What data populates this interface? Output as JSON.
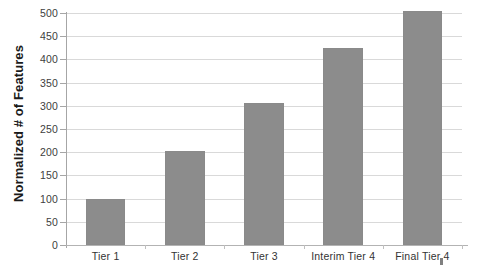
{
  "chart_data": {
    "type": "bar",
    "title": "",
    "xlabel": "",
    "ylabel": "Normalized # of Features",
    "categories": [
      "Tier 1",
      "Tier 2",
      "Tier 3",
      "Interim Tier 4",
      "Final Tier 4"
    ],
    "values": [
      100,
      203,
      305,
      425,
      505
    ],
    "ylim": [
      0,
      500
    ],
    "yticks": [
      0,
      50,
      100,
      150,
      200,
      250,
      300,
      350,
      400,
      450,
      500
    ],
    "ytick_labels": [
      "0",
      "50",
      "100",
      "150",
      "200",
      "250",
      "300",
      "350",
      "400",
      "450",
      "500"
    ],
    "grid": true,
    "grid_axis": "y",
    "legend": false,
    "series": [
      {
        "name": "Normalized # of Features",
        "values": [
          100,
          203,
          305,
          425,
          505
        ],
        "color": "#8c8c8c"
      }
    ],
    "colors": {
      "bar": "#8c8c8c",
      "bar_edge": "#8a8a8a",
      "gridline": "#d9d9d9",
      "axis": "#a6a6a6",
      "background": "#ffffff",
      "tick_text": "#404040",
      "axis_title": "#1a1a1a"
    }
  }
}
